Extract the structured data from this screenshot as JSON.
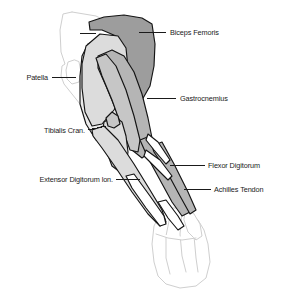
{
  "figure": {
    "background_color": "#ffffff",
    "outline_color": "#141414",
    "faint_outline_color": "#cfcfcf",
    "label_color": "#1a1a1a",
    "fills": {
      "dark_gray": "#9d9d9d",
      "medium_gray": "#b5b5b5",
      "light_gray": "#dcdcdc",
      "pale_gray": "#ececec",
      "white": "#ffffff"
    }
  },
  "labels": [
    {
      "id": "biceps-femoris",
      "text": "Biceps Femoris",
      "side": "right",
      "text_x": 170,
      "text_y": 35,
      "line": [
        139,
        32,
        166,
        32
      ]
    },
    {
      "id": "patella",
      "text": "Patella",
      "side": "left",
      "text_x": 48,
      "text_y": 80,
      "line": [
        52,
        77,
        76,
        77
      ]
    },
    {
      "id": "gastrocnemius",
      "text": "Gastrocnemius",
      "side": "right",
      "text_x": 180,
      "text_y": 101,
      "line": [
        147,
        98,
        176,
        98
      ]
    },
    {
      "id": "tibialis-cranialis",
      "text": "Tibialis Cran.",
      "side": "left",
      "text_x": 85,
      "text_y": 133,
      "line": [
        88,
        130,
        106,
        126
      ]
    },
    {
      "id": "extensor-digitorum",
      "text": "Extensor Digitorum lon.",
      "side": "left",
      "text_x": 113,
      "text_y": 182,
      "line": [
        116,
        179,
        140,
        179
      ]
    },
    {
      "id": "flexor-digitorum",
      "text": "Flexor Digitorum",
      "side": "right",
      "text_x": 208,
      "text_y": 168,
      "line": [
        170,
        165,
        205,
        165
      ]
    },
    {
      "id": "achilles-tendon",
      "text": "Achilles Tendon",
      "side": "right",
      "text_x": 214,
      "text_y": 192,
      "line": [
        184,
        189,
        211,
        189
      ]
    }
  ],
  "structures": [
    {
      "id": "biceps-femoris-belly",
      "name": "Biceps Femoris",
      "fill": "dark_gray"
    },
    {
      "id": "gastrocnemius-belly",
      "name": "Gastrocnemius",
      "fill": "medium_gray"
    },
    {
      "id": "fascia-band",
      "name": "Fascia Lata",
      "fill": "light_gray"
    },
    {
      "id": "tibialis-cranialis",
      "name": "Tibialis Cranialis",
      "fill": "light_gray"
    },
    {
      "id": "extensor-digitorum",
      "name": "Extensor Digitorum Longus",
      "fill": "light_gray"
    },
    {
      "id": "flexor-digitorum",
      "name": "Flexor Digitorum",
      "fill": "medium_gray"
    },
    {
      "id": "achilles-tendon",
      "name": "Achilles Tendon",
      "fill": "medium_gray"
    },
    {
      "id": "patella-outline",
      "name": "Patella",
      "fill": "white"
    },
    {
      "id": "pes-outline",
      "name": "Pes / Hock",
      "fill": "white"
    }
  ]
}
